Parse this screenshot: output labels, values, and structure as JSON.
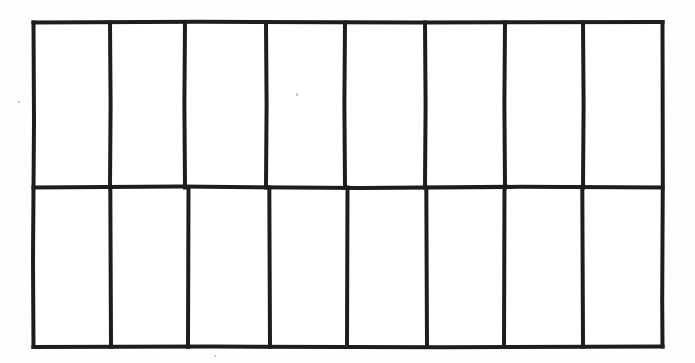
{
  "canvas": {
    "width": 695,
    "height": 363,
    "background_color": "#fefefe",
    "title": "Grid diagram"
  },
  "diagram": {
    "name": "two-row-eight-column-grid",
    "style": {
      "stroke_color": "#1d1d1d",
      "fill_color": "#ffffff",
      "outer_stroke_width": 4,
      "inner_stroke_width": 4,
      "hand_drawn": true
    },
    "outer_rect": {
      "left": 33,
      "top": 22,
      "right": 663,
      "bottom": 347,
      "width": 630,
      "height": 325
    },
    "rows": 2,
    "columns": 8,
    "row_divider_y": 187,
    "row_bounds": [
      {
        "index": 0,
        "top": 22,
        "bottom": 187,
        "height": 165
      },
      {
        "index": 1,
        "top": 187,
        "bottom": 347,
        "height": 160
      }
    ],
    "top_row_divider_x": [
      110,
      185,
      266,
      345,
      425,
      505,
      583
    ],
    "bottom_row_divider_x": [
      111,
      188,
      270,
      347,
      427,
      504,
      583
    ],
    "cells": [
      {
        "row": 0,
        "col": 0,
        "label": ""
      },
      {
        "row": 0,
        "col": 1,
        "label": ""
      },
      {
        "row": 0,
        "col": 2,
        "label": ""
      },
      {
        "row": 0,
        "col": 3,
        "label": ""
      },
      {
        "row": 0,
        "col": 4,
        "label": ""
      },
      {
        "row": 0,
        "col": 5,
        "label": ""
      },
      {
        "row": 0,
        "col": 6,
        "label": ""
      },
      {
        "row": 0,
        "col": 7,
        "label": ""
      },
      {
        "row": 1,
        "col": 0,
        "label": ""
      },
      {
        "row": 1,
        "col": 1,
        "label": ""
      },
      {
        "row": 1,
        "col": 2,
        "label": ""
      },
      {
        "row": 1,
        "col": 3,
        "label": ""
      },
      {
        "row": 1,
        "col": 4,
        "label": ""
      },
      {
        "row": 1,
        "col": 5,
        "label": ""
      },
      {
        "row": 1,
        "col": 6,
        "label": ""
      },
      {
        "row": 1,
        "col": 7,
        "label": ""
      }
    ],
    "artifacts": [
      {
        "name": "scan-speck-top-left",
        "x": 18,
        "y": 101,
        "size": 2
      },
      {
        "name": "scan-speck-top-mid",
        "x": 296,
        "y": 93,
        "size": 2
      },
      {
        "name": "scan-speck-bottom-center",
        "x": 214,
        "y": 355,
        "size": 2
      }
    ]
  }
}
